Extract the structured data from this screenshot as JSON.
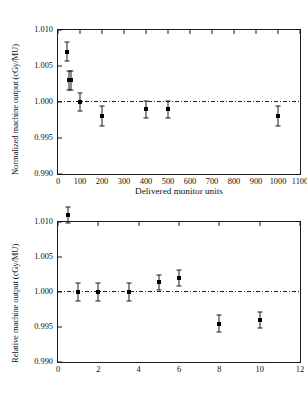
{
  "figure": {
    "title": "",
    "panels": 2
  },
  "chart_data": [
    {
      "type": "scatter",
      "panel": "top",
      "title": "",
      "xlabel": "Delivered monitor units",
      "ylabel": "Normalized machine output (cGy/MU)",
      "xlim": [
        0,
        1100
      ],
      "ylim": [
        0.99,
        1.01
      ],
      "xticks": [
        0,
        100,
        200,
        300,
        400,
        500,
        600,
        700,
        800,
        900,
        1000,
        1100
      ],
      "xticklabels": [
        "0",
        "100",
        "200",
        "300",
        "400",
        "500",
        "600",
        "700",
        "800",
        "900",
        "1000",
        "1100"
      ],
      "yticks": [
        0.99,
        0.995,
        1.0,
        1.005,
        1.01
      ],
      "yticklabels": [
        "0.990",
        "0.995",
        "1.000",
        "1.005",
        "1.010"
      ],
      "grid": false,
      "legend": null,
      "reference_line": {
        "y": 1.0,
        "style": "dash-dot"
      },
      "x": [
        40,
        50,
        60,
        100,
        200,
        400,
        500,
        1000
      ],
      "values": [
        1.007,
        1.003,
        1.003,
        1.0,
        0.998,
        0.999,
        0.999,
        0.998
      ],
      "yerr": [
        0.0013,
        0.0013,
        0.0013,
        0.0012,
        0.0014,
        0.0012,
        0.0012,
        0.0014
      ]
    },
    {
      "type": "scatter",
      "panel": "bottom",
      "title": "",
      "xlabel": "Beam current (nA)",
      "ylabel": "Relative machine output (cGy/MU)",
      "xlim": [
        0,
        12
      ],
      "ylim": [
        0.99,
        1.01
      ],
      "xticks": [
        0,
        2,
        4,
        6,
        8,
        10,
        12
      ],
      "xticklabels": [
        "0",
        "2",
        "4",
        "6",
        "8",
        "10",
        "12"
      ],
      "yticks": [
        0.99,
        0.995,
        1.0,
        1.005,
        1.01
      ],
      "yticklabels": [
        "0.990",
        "0.995",
        "1.000",
        "1.005",
        "1.010"
      ],
      "grid": false,
      "legend": null,
      "reference_line": {
        "y": 1.0,
        "style": "dash-dot"
      },
      "x": [
        0.5,
        1.0,
        2.0,
        3.5,
        5.0,
        6.0,
        8.0,
        10.0
      ],
      "values": [
        1.011,
        1.0,
        1.0,
        1.0,
        1.0014,
        1.002,
        0.9955,
        0.996
      ],
      "yerr": [
        0.0012,
        0.0013,
        0.0013,
        0.0013,
        0.0011,
        0.0011,
        0.0012,
        0.0011
      ]
    }
  ]
}
